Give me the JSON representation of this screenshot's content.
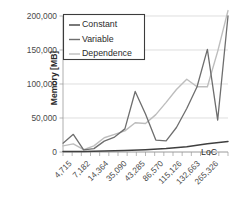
{
  "chart_data": {
    "type": "line",
    "title": "",
    "xlabel": "LoC",
    "ylabel": "Memory [MB]",
    "categories": [
      "4,715",
      "7,182",
      "14,364",
      "35,090",
      "43,285",
      "86,570",
      "115,126",
      "132,663",
      "265,326"
    ],
    "x_tick_labels": [
      "4,715",
      "7,182",
      "14,364",
      "35,090",
      "43,285",
      "86,570",
      "115,126",
      "132,663",
      "265,326"
    ],
    "y_tick_labels": [
      "0",
      "50,000",
      "100,000",
      "150,000",
      "200,000"
    ],
    "y_tick_values": [
      0,
      50000,
      100000,
      150000,
      200000
    ],
    "ylim": [
      0,
      200000
    ],
    "grid": true,
    "legend_position": "top-left-inside",
    "series": [
      {
        "name": "Constant",
        "color": "#3f3f3f",
        "values": [
          700,
          900,
          1100,
          1800,
          2600,
          4200,
          6600,
          9800,
          15500
        ]
      },
      {
        "name": "Variable",
        "color": "#6e6e6e",
        "values": [
          13000,
          26000,
          3000,
          22000,
          89000,
          17500,
          64000,
          151000,
          47000
        ]
      },
      {
        "name": "Dependence",
        "color": "#bdbdbd",
        "values": [
          9000,
          10500,
          3500,
          33000,
          42000,
          73000,
          107000,
          96000,
          200000
        ]
      }
    ],
    "series_extra_points": {
      "Variable": [
        {
          "x_frac": 0.0,
          "value": 13000
        },
        {
          "x_frac": 0.0625,
          "value": 26000
        },
        {
          "x_frac": 0.125,
          "value": 3000
        },
        {
          "x_frac": 0.1875,
          "value": 5000
        },
        {
          "x_frac": 0.25,
          "value": 16000
        },
        {
          "x_frac": 0.3125,
          "value": 22000
        },
        {
          "x_frac": 0.375,
          "value": 34000
        },
        {
          "x_frac": 0.4375,
          "value": 89000
        },
        {
          "x_frac": 0.5,
          "value": 56000
        },
        {
          "x_frac": 0.5625,
          "value": 17500
        },
        {
          "x_frac": 0.625,
          "value": 16500
        },
        {
          "x_frac": 0.6875,
          "value": 36000
        },
        {
          "x_frac": 0.75,
          "value": 64000
        },
        {
          "x_frac": 0.8125,
          "value": 96000
        },
        {
          "x_frac": 0.875,
          "value": 151000
        },
        {
          "x_frac": 0.9375,
          "value": 47000
        },
        {
          "x_frac": 1.0,
          "value": 200000
        }
      ],
      "Dependence": [
        {
          "x_frac": 0.0,
          "value": 9000
        },
        {
          "x_frac": 0.0625,
          "value": 12000
        },
        {
          "x_frac": 0.125,
          "value": 3500
        },
        {
          "x_frac": 0.1875,
          "value": 9000
        },
        {
          "x_frac": 0.25,
          "value": 21000
        },
        {
          "x_frac": 0.3125,
          "value": 26000
        },
        {
          "x_frac": 0.375,
          "value": 31000
        },
        {
          "x_frac": 0.4375,
          "value": 43000
        },
        {
          "x_frac": 0.5,
          "value": 42000
        },
        {
          "x_frac": 0.5625,
          "value": 55000
        },
        {
          "x_frac": 0.625,
          "value": 73000
        },
        {
          "x_frac": 0.6875,
          "value": 92000
        },
        {
          "x_frac": 0.75,
          "value": 107000
        },
        {
          "x_frac": 0.8125,
          "value": 96000
        },
        {
          "x_frac": 0.875,
          "value": 96000
        },
        {
          "x_frac": 0.9375,
          "value": 148000
        },
        {
          "x_frac": 1.0,
          "value": 208000
        }
      ],
      "Constant": [
        {
          "x_frac": 0.0,
          "value": 700
        },
        {
          "x_frac": 0.125,
          "value": 900
        },
        {
          "x_frac": 0.25,
          "value": 1400
        },
        {
          "x_frac": 0.375,
          "value": 2200
        },
        {
          "x_frac": 0.5,
          "value": 3400
        },
        {
          "x_frac": 0.625,
          "value": 5200
        },
        {
          "x_frac": 0.75,
          "value": 7800
        },
        {
          "x_frac": 0.875,
          "value": 12000
        },
        {
          "x_frac": 1.0,
          "value": 15500
        }
      ]
    }
  },
  "legend": {
    "items": [
      {
        "label": "Constant"
      },
      {
        "label": "Variable"
      },
      {
        "label": "Dependence"
      }
    ]
  },
  "axes": {
    "y_title": "Memory [MB]",
    "x_title": "LoC"
  }
}
